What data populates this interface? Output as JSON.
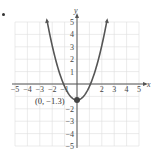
{
  "chart_data": {
    "type": "line",
    "title": "",
    "xlabel": "x",
    "ylabel": "y",
    "xlim": [
      -5,
      5
    ],
    "ylim": [
      -5,
      5
    ],
    "grid": true,
    "x_ticks": [
      "-5",
      "-4",
      "-3",
      "-2",
      "-1",
      "2",
      "3",
      "4",
      "5"
    ],
    "y_ticks": [
      "5",
      "4",
      "3",
      "2",
      "1",
      "-2",
      "-3",
      "-4",
      "-5"
    ],
    "series": [
      {
        "name": "parabola",
        "equation_estimate": "y = 1.1x^2 - 1.3",
        "x": [
          -2.4,
          -2,
          -1.5,
          -1,
          -0.5,
          0,
          0.5,
          1,
          1.5,
          2,
          2.4
        ],
        "y": [
          5.0,
          3.1,
          1.2,
          -0.2,
          -1.0,
          -1.3,
          -1.0,
          -0.2,
          1.2,
          3.1,
          5.0
        ],
        "color": "#555555"
      }
    ],
    "annotations": [
      {
        "text": "(0, −1.3)",
        "x": 0,
        "y": -1.3,
        "type": "vertex-point"
      }
    ]
  },
  "labels": {
    "x_axis": "x",
    "y_axis": "y",
    "vertex": "(0, −1.3)"
  },
  "colors": {
    "grid": "#dddddd",
    "axis": "#555555",
    "curve": "#555555",
    "point": "#444444"
  }
}
